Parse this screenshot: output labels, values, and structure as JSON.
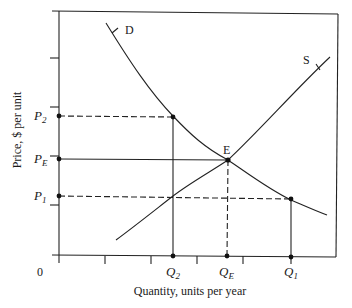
{
  "diagram": {
    "type": "supply-demand",
    "x_axis_label": "Quantity, units per year",
    "y_axis_label": "Price, $ per unit",
    "origin_label": "0",
    "curves": {
      "demand": {
        "label": "D"
      },
      "supply": {
        "label": "S"
      }
    },
    "equilibrium": {
      "label": "E"
    },
    "price_labels": [
      {
        "id": "P2",
        "base": "P",
        "sub": "2"
      },
      {
        "id": "PE",
        "base": "P",
        "sub": "E"
      },
      {
        "id": "P1",
        "base": "P",
        "sub": "1"
      }
    ],
    "quantity_labels": [
      {
        "id": "Q2",
        "base": "Q",
        "sub": "2"
      },
      {
        "id": "QE",
        "base": "Q",
        "sub": "E"
      },
      {
        "id": "Q1",
        "base": "Q",
        "sub": "1"
      }
    ],
    "colors": {
      "ink": "#222222",
      "background": "#ffffff"
    }
  }
}
